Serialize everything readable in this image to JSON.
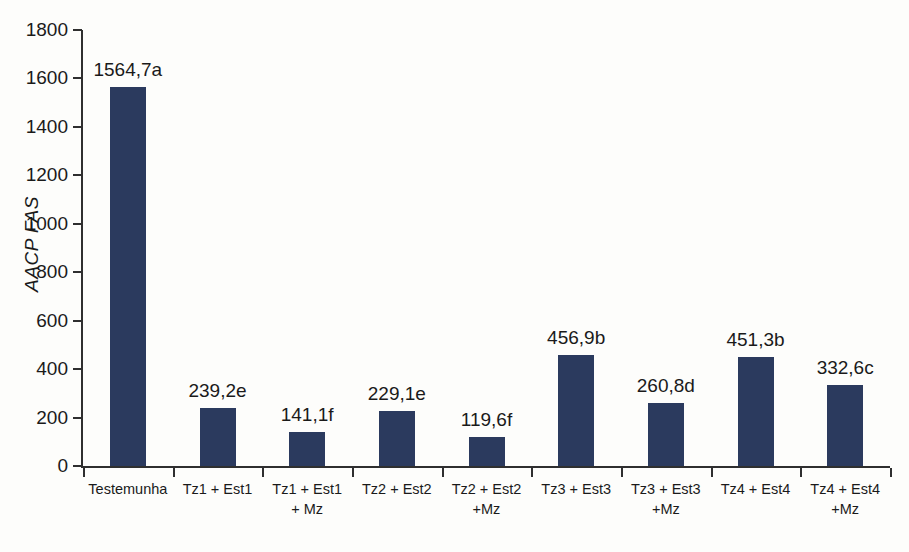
{
  "chart_data": {
    "type": "bar",
    "title": "",
    "xlabel": "",
    "ylabel": "AACP FAS",
    "ylim": [
      0,
      1800
    ],
    "ytick_step": 200,
    "yticks": [
      0,
      200,
      400,
      600,
      800,
      1000,
      1200,
      1400,
      1600,
      1800
    ],
    "ytick_labels": [
      "0",
      "200",
      "400",
      "600",
      "800",
      "1000",
      "1200",
      "1400",
      "1600",
      "1800"
    ],
    "grid": false,
    "legend": false,
    "bar_color": "#2b3a5e",
    "axis_color": "#2f2f2f",
    "background_color": "#fdfdfb",
    "decimal_separator": ",",
    "categories": [
      "Testemunha",
      "Tz1 + Est1",
      "Tz1 + Est1\n+ Mz",
      "Tz2 + Est2",
      "Tz2 + Est2\n+Mz",
      "Tz3 + Est3",
      "Tz3 + Est3\n+Mz",
      "Tz4 + Est4",
      "Tz4 + Est4\n+Mz"
    ],
    "values": [
      1564.7,
      239.2,
      141.1,
      229.1,
      119.6,
      456.9,
      260.8,
      451.3,
      332.6
    ],
    "data_labels": [
      "1564,7a",
      "239,2e",
      "141,1f",
      "229,1e",
      "119,6f",
      "456,9b",
      "260,8d",
      "451,3b",
      "332,6c"
    ],
    "significance_letters": [
      "a",
      "e",
      "f",
      "e",
      "f",
      "b",
      "d",
      "b",
      "c"
    ]
  }
}
